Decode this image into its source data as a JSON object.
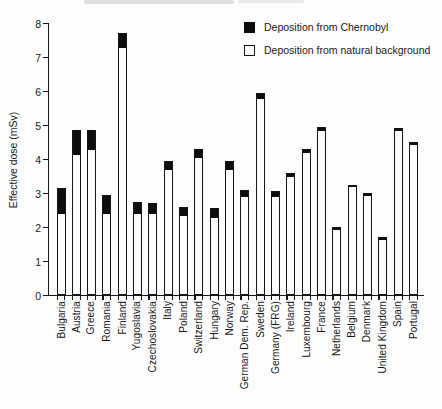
{
  "chart_data": {
    "type": "bar",
    "stacked": true,
    "title": "",
    "xlabel": "",
    "ylabel": "Effective dose (mSv)",
    "ylim": [
      0,
      8
    ],
    "yticks": [
      0,
      1,
      2,
      3,
      4,
      5,
      6,
      7,
      8
    ],
    "grid": false,
    "legend_position": "top-right",
    "categories": [
      "Bulgaria",
      "Austria",
      "Greece",
      "Romania",
      "Finland",
      "Yugoslavia",
      "Czechoslovakia",
      "Italy",
      "Poland",
      "Switzerland",
      "Hungary",
      "Norway",
      "German Dem. Rep.",
      "Sweden",
      "Germany (FRG)",
      "Ireland",
      "Luxembourg",
      "France",
      "Netherlands",
      "Belgium",
      "Denmark",
      "United Kingdom",
      "Spain",
      "Portugal"
    ],
    "series": [
      {
        "name": "Deposition from natural background",
        "color": "#ffffff",
        "values": [
          2.4,
          4.15,
          4.3,
          2.4,
          7.3,
          2.4,
          2.4,
          3.7,
          2.35,
          4.05,
          2.3,
          3.7,
          2.9,
          5.8,
          2.9,
          3.5,
          4.2,
          4.85,
          1.95,
          3.2,
          2.95,
          1.65,
          4.85,
          4.45
        ]
      },
      {
        "name": "Deposition from Chernobyl",
        "color": "#0d0d0d",
        "values": [
          0.75,
          0.7,
          0.55,
          0.55,
          0.4,
          0.35,
          0.3,
          0.25,
          0.25,
          0.25,
          0.25,
          0.25,
          0.2,
          0.15,
          0.15,
          0.1,
          0.1,
          0.1,
          0.05,
          0.05,
          0.05,
          0.05,
          0.05,
          0.05
        ]
      }
    ],
    "totals": [
      3.15,
      4.85,
      4.85,
      2.95,
      7.7,
      2.75,
      2.7,
      3.95,
      2.6,
      4.3,
      2.55,
      3.95,
      3.1,
      5.95,
      3.05,
      3.6,
      4.3,
      4.95,
      2.0,
      3.25,
      3.0,
      1.7,
      4.9,
      4.5
    ]
  }
}
